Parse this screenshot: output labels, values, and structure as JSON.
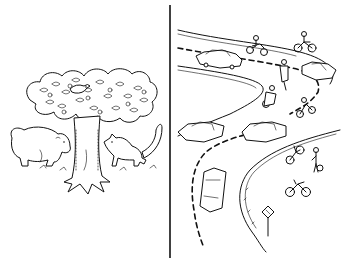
{
  "image": {
    "style": "black-and-white line drawing",
    "background": "#ffffff",
    "ink": "#111111"
  },
  "panels": [
    {
      "id": "left",
      "subject": "forest scene",
      "elements": [
        "tree",
        "bear",
        "fox",
        "bird"
      ]
    },
    {
      "id": "right",
      "subject": "curving road scene",
      "elements": [
        "cars",
        "motorcycles",
        "bicycles",
        "pedestrian",
        "road-sign",
        "dashed-center-line"
      ]
    }
  ],
  "divider": {
    "x": 170,
    "y_start": 5,
    "y_end": 258
  }
}
